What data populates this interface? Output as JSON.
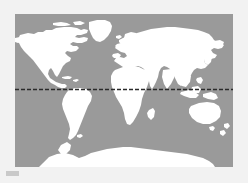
{
  "figure": {
    "kind": "world-map",
    "background_color": "#f2f2f2"
  },
  "map": {
    "projection": "equirectangular",
    "ocean_color": "#9a9a9a",
    "land_color": "#ffffff",
    "panel": {
      "x": 15,
      "y": 14,
      "width": 218,
      "height": 153
    },
    "lon_range": [
      -180,
      180
    ],
    "lat_range": [
      -90,
      83
    ],
    "landmasses": [
      "north-america",
      "greenland",
      "south-america",
      "eurasia",
      "africa",
      "australia",
      "antarctica",
      "new-zealand",
      "madagascar",
      "british-isles",
      "japan",
      "indonesia",
      "caribbean"
    ]
  },
  "equator": {
    "label": "Equator",
    "latitude": 0,
    "style": "dashed",
    "color": "#2a2a2a",
    "stroke_width": 1.6,
    "dash_length": 4,
    "dash_gap": 2,
    "y_position": 89
  },
  "caption": {
    "mark_color": "#c9c9c9"
  }
}
